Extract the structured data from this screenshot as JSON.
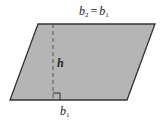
{
  "figure": {
    "type": "parallelogram",
    "fill_color": "#b5b5b5",
    "stroke_color": "#333333",
    "vertices": {
      "top_left": [
        38,
        24
      ],
      "top_right": [
        155,
        24
      ],
      "bottom_right": [
        127,
        100
      ],
      "bottom_left": [
        10,
        100
      ]
    },
    "height_line": {
      "x": 53,
      "y_top": 24,
      "y_bottom": 100,
      "style": "dashed"
    },
    "right_angle_marker": {
      "x": 53,
      "y": 100,
      "size": 7
    }
  },
  "labels": {
    "top_base": {
      "var": "b",
      "sub": "2",
      "equals": "=",
      "var2": "b",
      "sub2": "1"
    },
    "height": "h",
    "bottom_base": {
      "var": "b",
      "sub": "1"
    }
  }
}
